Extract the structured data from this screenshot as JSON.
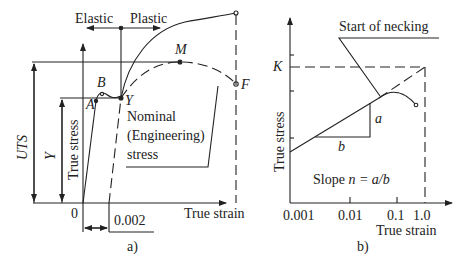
{
  "panel_a": {
    "caption": "a)",
    "labels": {
      "elastic": "Elastic",
      "plastic": "Plastic",
      "point_B": "B",
      "point_A": "A",
      "point_Y": "Y",
      "point_M": "M",
      "point_F": "F",
      "uts": "UTS",
      "yield": "Y",
      "y_axis": "True stress",
      "x_axis": "True strain",
      "origin": "0",
      "offset": "0.002",
      "nominal_line1": "Nominal",
      "nominal_line2": "(Engineering)",
      "nominal_line3": "stress"
    }
  },
  "panel_b": {
    "caption": "b)",
    "labels": {
      "necking": "Start of necking",
      "K": "K",
      "a": "a",
      "b": "b",
      "y_axis": "True stress",
      "x_axis": "True strain",
      "slope_prefix": "Slope ",
      "slope_formula": "n = a/b"
    },
    "x_ticks": [
      "0.001",
      "0.01",
      "0.1",
      "1.0"
    ]
  }
}
